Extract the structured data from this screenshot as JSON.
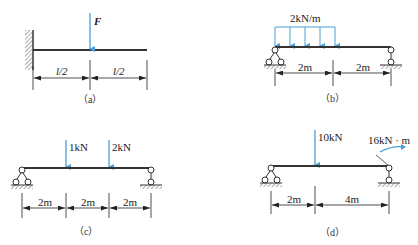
{
  "colors": {
    "beam": "#333333",
    "load": "#4a9fd8",
    "text": "#222222",
    "hatch": "#555555"
  },
  "diagrams": [
    {
      "id": "a",
      "caption": "（a）",
      "support": "fixed-wall-left",
      "loads": [
        {
          "type": "point",
          "label": "F",
          "position": "midspan"
        }
      ],
      "dimensions": [
        "l/2",
        "l/2"
      ]
    },
    {
      "id": "b",
      "caption": "（b）",
      "supports": [
        "pin-left",
        "roller-right"
      ],
      "loads": [
        {
          "type": "distributed",
          "label": "2kN/m",
          "span": "left half"
        }
      ],
      "dimensions": [
        "2m",
        "2m"
      ]
    },
    {
      "id": "c",
      "caption": "（c）",
      "supports": [
        "pin-left",
        "roller-right"
      ],
      "loads": [
        {
          "type": "point",
          "label": "1kN"
        },
        {
          "type": "point",
          "label": "2kN"
        }
      ],
      "dimensions": [
        "2m",
        "2m",
        "2m"
      ]
    },
    {
      "id": "d",
      "caption": "（d）",
      "supports": [
        "pin-left",
        "roller-right"
      ],
      "loads": [
        {
          "type": "point",
          "label": "10kN"
        },
        {
          "type": "moment",
          "label": "16kN · m",
          "position": "right end"
        }
      ],
      "dimensions": [
        "2m",
        "4m"
      ]
    }
  ]
}
